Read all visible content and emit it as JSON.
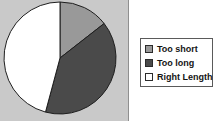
{
  "chart_data": {
    "type": "pie",
    "title": "",
    "categories": [
      "Too short",
      "Too long",
      "Right Length"
    ],
    "values": [
      14.4,
      39.7,
      45.9
    ],
    "units": "percent",
    "start_angle_deg": 0,
    "direction": "clockwise",
    "slice_angles_deg": [
      52,
      143,
      165
    ],
    "colors": [
      "#999999",
      "#4a4a4a",
      "#ffffff"
    ],
    "legend_position": "right",
    "grid": false,
    "xlabel": "",
    "ylabel": ""
  },
  "plot": {
    "background_color": "#c9c9c9",
    "border_color": "#8f8f8f",
    "slice_outline_color": "#1e1e1e"
  },
  "legend": {
    "background_color": "#ffffff",
    "border_color": "#5a5a5a",
    "items": [
      {
        "label": "Too short",
        "color": "#999999",
        "swatch_name": "swatch-too-short"
      },
      {
        "label": "Too long",
        "color": "#4a4a4a",
        "swatch_name": "swatch-too-long"
      },
      {
        "label": "Right Length",
        "color": "#ffffff",
        "swatch_name": "swatch-right-length"
      }
    ]
  }
}
